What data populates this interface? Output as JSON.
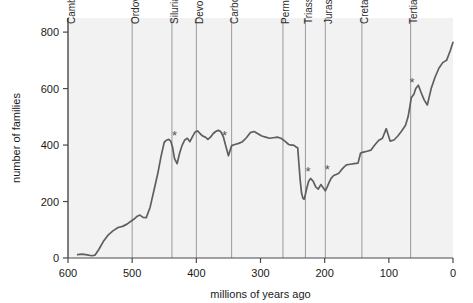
{
  "chart_data": {
    "type": "line",
    "title": "",
    "xlabel": "millions of years ago",
    "ylabel": "number of families",
    "xlim": [
      600,
      0
    ],
    "ylim": [
      0,
      850
    ],
    "x_reversed": true,
    "grid": false,
    "legend": null,
    "xticks": [
      600,
      500,
      400,
      300,
      200,
      100,
      0
    ],
    "xtick_labels": [
      "600",
      "500",
      "400",
      "300",
      "200",
      "100",
      "0"
    ],
    "yticks": [
      0,
      200,
      400,
      600,
      800
    ],
    "ytick_labels": [
      "0",
      "200",
      "400",
      "600",
      "800"
    ],
    "series": [
      {
        "name": "number of families",
        "color": "#5f5f5f",
        "x": [
          585,
          578,
          570,
          563,
          558,
          552,
          545,
          538,
          530,
          522,
          515,
          508,
          502,
          497,
          492,
          488,
          483,
          478,
          472,
          466,
          460,
          455,
          450,
          446,
          443,
          440,
          437,
          434,
          430,
          426,
          422,
          418,
          414,
          410,
          406,
          402,
          398,
          394,
          390,
          386,
          382,
          378,
          374,
          370,
          366,
          362,
          358,
          354,
          350,
          345,
          340,
          334,
          328,
          322,
          316,
          310,
          304,
          298,
          292,
          286,
          280,
          274,
          268,
          262,
          256,
          252,
          249,
          246,
          244,
          242,
          240,
          238,
          236,
          234,
          232,
          230,
          228,
          225,
          222,
          218,
          214,
          210,
          206,
          202,
          199,
          196,
          193,
          190,
          186,
          182,
          178,
          174,
          170,
          166,
          160,
          154,
          148,
          144,
          141,
          138,
          134,
          128,
          122,
          116,
          110,
          104,
          98,
          92,
          86,
          80,
          74,
          70,
          67,
          65,
          63,
          61,
          58,
          54,
          50,
          45,
          40,
          34,
          28,
          22,
          16,
          10,
          4,
          0
        ],
        "y": [
          12,
          14,
          11,
          8,
          10,
          30,
          58,
          80,
          96,
          108,
          112,
          120,
          130,
          138,
          148,
          152,
          144,
          143,
          180,
          240,
          300,
          360,
          410,
          418,
          420,
          414,
          392,
          352,
          334,
          372,
          400,
          418,
          424,
          412,
          430,
          446,
          450,
          440,
          432,
          428,
          420,
          428,
          440,
          448,
          452,
          448,
          430,
          396,
          362,
          398,
          402,
          406,
          412,
          426,
          444,
          448,
          440,
          432,
          428,
          424,
          426,
          428,
          424,
          414,
          402,
          400,
          400,
          396,
          392,
          390,
          330,
          272,
          230,
          212,
          208,
          226,
          246,
          272,
          282,
          272,
          252,
          244,
          260,
          248,
          238,
          252,
          268,
          282,
          292,
          296,
          300,
          312,
          322,
          330,
          332,
          334,
          336,
          372,
          374,
          376,
          378,
          382,
          400,
          416,
          424,
          458,
          414,
          418,
          432,
          450,
          470,
          500,
          540,
          568,
          574,
          580,
          600,
          612,
          588,
          560,
          542,
          600,
          640,
          672,
          692,
          700,
          736,
          764
        ]
      }
    ],
    "annotations": [
      {
        "label": "*",
        "name": "extinction-marker-ordovician",
        "x": 434,
        "y": 418,
        "description": "end-Ordovician mass extinction"
      },
      {
        "label": "*",
        "name": "extinction-marker-devonian",
        "x": 356,
        "y": 418,
        "description": "late Devonian mass extinction"
      },
      {
        "label": "*",
        "name": "extinction-marker-permian",
        "x": 226,
        "y": 292,
        "description": "end-Permian mass extinction"
      },
      {
        "label": "*",
        "name": "extinction-marker-triassic",
        "x": 196,
        "y": 296,
        "description": "end-Triassic mass extinction"
      },
      {
        "label": "*",
        "name": "extinction-marker-cretaceous",
        "x": 64,
        "y": 606,
        "description": "end-Cretaceous (K-Pg) mass extinction"
      }
    ],
    "period_boundaries": [
      {
        "label": "Cambrian",
        "boundary_x": 600,
        "label_x": 589
      },
      {
        "label": "Ordovician",
        "boundary_x": 500,
        "label_x": 489
      },
      {
        "label": "Silurian",
        "boundary_x": 438,
        "label_x": 428
      },
      {
        "label": "Devonian",
        "boundary_x": 400,
        "label_x": 390
      },
      {
        "label": "Carboniferous",
        "boundary_x": 345,
        "label_x": 335
      },
      {
        "label": "Permian",
        "boundary_x": 265,
        "label_x": 255
      },
      {
        "label": "Triassic",
        "boundary_x": 230,
        "label_x": 220
      },
      {
        "label": "Jurassic",
        "boundary_x": 199,
        "label_x": 189
      },
      {
        "label": "Cretaceous",
        "boundary_x": 142,
        "label_x": 132
      },
      {
        "label": "Tertiary",
        "boundary_x": 66,
        "label_x": 56
      }
    ],
    "colors": {
      "line": "#5f5f5f",
      "plot_background": "#f2f2f2",
      "boundary_line": "#9a9a9a",
      "axis": "#4a4a4a",
      "text": "#1a1a1a",
      "page_background": "#ffffff"
    }
  }
}
